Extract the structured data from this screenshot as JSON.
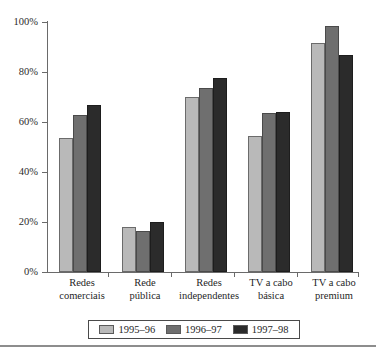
{
  "chart_data": {
    "type": "bar",
    "title": "",
    "subtitle": "",
    "xlabel": "",
    "ylabel": "",
    "ylim": [
      0,
      100
    ],
    "ytick_labels": [
      "0%",
      "20%",
      "40%",
      "60%",
      "80%",
      "100%"
    ],
    "ytick_values": [
      0,
      20,
      40,
      60,
      80,
      100
    ],
    "grid": false,
    "legend_position": "bottom",
    "categories": [
      "Redes\ncomerciais",
      "Rede\npública",
      "Redes\nindependentes",
      "TV a cabo\nbásica",
      "TV a cabo\npremium"
    ],
    "series": [
      {
        "name": "1995–96",
        "color": "#b9b9b9",
        "values": [
          53.5,
          18.0,
          70.0,
          54.5,
          91.5
        ]
      },
      {
        "name": "1996–97",
        "color": "#6f6f6f",
        "values": [
          63.0,
          16.5,
          73.5,
          63.5,
          98.5
        ]
      },
      {
        "name": "1997–98",
        "color": "#2b2b2b",
        "values": [
          67.0,
          20.0,
          77.5,
          64.0,
          87.0
        ]
      }
    ]
  },
  "legend": {
    "items": [
      {
        "label": "1995–96",
        "swatch": "legend-swatch-1995-96"
      },
      {
        "label": "1996–97",
        "swatch": "legend-swatch-1996-97"
      },
      {
        "label": "1997–98",
        "swatch": "legend-swatch-1997-98"
      }
    ]
  },
  "axis": {
    "y": {
      "labels": [
        "100%",
        "80%",
        "60%",
        "40%",
        "20%",
        "0%"
      ]
    },
    "x": {
      "labels": [
        "Redes\ncomerciais",
        "Rede\npública",
        "Redes\nindependentes",
        "TV a cabo\nbásica",
        "TV a cabo\npremium"
      ]
    }
  },
  "colors": {
    "series_1995_96": "#b9b9b9",
    "series_1996_97": "#6f6f6f",
    "series_1997_98": "#2b2b2b",
    "axis": "#6a6a6a",
    "background": "#ffffff"
  }
}
